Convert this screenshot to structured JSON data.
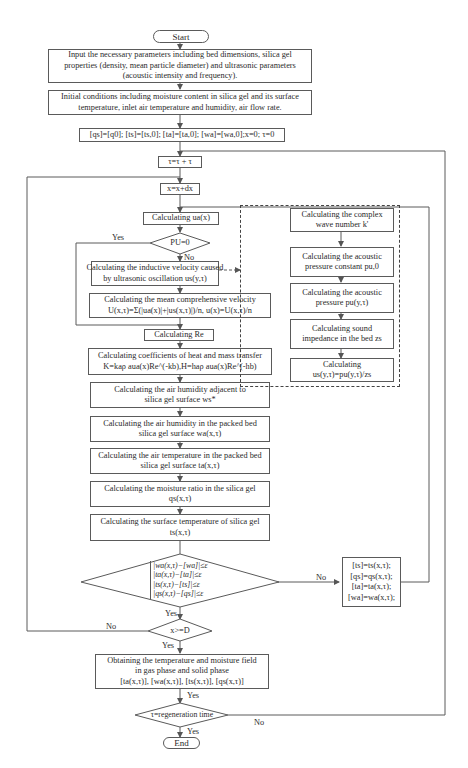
{
  "flowchart": {
    "start": "Start",
    "end": "End",
    "input_params": [
      "Input the necessary parameters including bed dimensions, silica gel",
      "properties (density, mean particle diameter) and ultrasonic parameters",
      "(acoustic intensity and frequency)."
    ],
    "initial_conditions": [
      "Initial conditions including moisture content in silica gel and its surface",
      "temperature, inlet air temperature and humidity, air flow rate."
    ],
    "initialization": "[qs]=[q0]; [ts]=[ts,0]; [ta]=[ta,0]; [wa]=[wa,0];x=0; τ=0",
    "time_step": "τ=τ + τ",
    "space_step": "x=x+dx",
    "calc_ua": "Calculating ua(x)",
    "decision_pu": "PU=0",
    "decision_pu_yes": "Yes",
    "decision_pu_no": "No",
    "calc_inductive_velocity": [
      "Calculating the inductive velocity caused",
      "by ultrasonic oscillation us(y,τ)"
    ],
    "calc_mean_velocity": [
      "Calculating the mean comprehensive velocity",
      "U(x,τ)=Σ(|ua(x)|+|us(x,τ)|)/n, u(x)=U(x,τ)/n"
    ],
    "calc_re": "Calculating Re",
    "calc_coefficients": [
      "Calculating coefficients of heat and mass transfer",
      "K=kaρ aua(x)Re^(-kb),H=haρ aua(x)Re^(-hb)"
    ],
    "calc_humidity_adjacent": [
      "Calculating the air humidity adjacent to",
      "silica gel surface ws*"
    ],
    "calc_air_humidity": [
      "Calculating the air humidity in the packed bed",
      "silica gel surface wa(x,τ)"
    ],
    "calc_air_temperature": [
      "Calculating the air temperature in the packed bed",
      "silica gel surface ta(x,τ)"
    ],
    "calc_moisture_ratio": [
      "Calculating the moisture ratio in the silica gel",
      "qs(x,τ)"
    ],
    "calc_surface_temperature": [
      "Calculating the surface temperature of silica gel",
      "ts(x,τ)"
    ],
    "convergence_check": [
      "|wa(x,τ)−[wa]|≤ε",
      "|ta(x,τ)−[ta]|≤ε",
      "|ts(x,τ)−[ts]|≤ε",
      "|qs(x,τ)−[qs]|≤ε"
    ],
    "convergence_yes": "Yes",
    "convergence_no": "No",
    "update_values": [
      "[ts]=ts(x,τ);",
      "[qs]=qs(x,τ);",
      "[ta]=ta(x,τ);",
      "[wa]=wa(x,τ);"
    ],
    "decision_x": "x>=D",
    "decision_x_yes": "Yes",
    "decision_x_no": "No",
    "obtain_fields": [
      "Obtaining the temperature and moisture field",
      "in gas phase and solid phase",
      "[ta(x,τ)], [wa(x,τ)], [ts(x,τ)], [qs(x,τ)]"
    ],
    "obtain_yes": "Yes",
    "decision_regen": "τ=regeneration time",
    "decision_regen_yes": "Yes",
    "decision_regen_no": "No",
    "ultrasonic_subprocess": {
      "steps": [
        [
          "Calculating the complex",
          "wave number k'"
        ],
        [
          "Calculating the acoustic",
          "pressure constant pu,0"
        ],
        [
          "Calculating the acoustic",
          "pressure pu(y,τ)"
        ],
        [
          "Calculating sound",
          "impedance in the bed zs"
        ],
        [
          "Calculating",
          "us(y,τ)=pu(y,τ)/zs"
        ]
      ]
    }
  },
  "colors": {
    "line": "#5a5a5a",
    "text": "#2a2a2a",
    "background": "#ffffff"
  }
}
